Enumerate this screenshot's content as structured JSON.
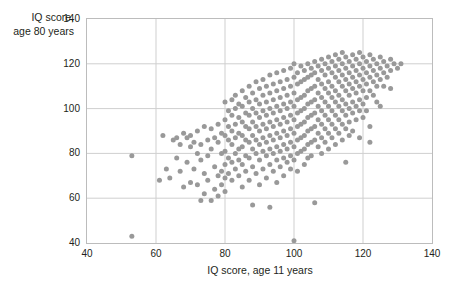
{
  "chart_data": {
    "type": "scatter",
    "title": "",
    "xlabel": "IQ score, age 11 years",
    "ylabel": "IQ score,\nage 80 years",
    "xlim": [
      40,
      140
    ],
    "ylim": [
      40,
      140
    ],
    "xticks": [
      40,
      60,
      80,
      100,
      120,
      140
    ],
    "yticks": [
      40,
      60,
      80,
      100,
      120,
      140
    ],
    "grid": true,
    "legend": null,
    "point_color": "#999999",
    "point_size": 5,
    "n_points": 349,
    "points": [
      [
        53,
        79
      ],
      [
        53,
        43
      ],
      [
        61,
        68
      ],
      [
        62,
        88
      ],
      [
        63,
        73
      ],
      [
        64,
        69
      ],
      [
        65,
        86
      ],
      [
        66,
        87
      ],
      [
        66,
        78
      ],
      [
        67,
        84
      ],
      [
        67,
        72
      ],
      [
        68,
        89
      ],
      [
        68,
        65
      ],
      [
        69,
        87
      ],
      [
        69,
        76
      ],
      [
        70,
        88
      ],
      [
        70,
        83
      ],
      [
        70,
        67
      ],
      [
        71,
        85
      ],
      [
        71,
        73
      ],
      [
        72,
        90
      ],
      [
        72,
        80
      ],
      [
        72,
        66
      ],
      [
        73,
        84
      ],
      [
        73,
        77
      ],
      [
        73,
        59
      ],
      [
        74,
        92
      ],
      [
        74,
        71
      ],
      [
        74,
        62
      ],
      [
        75,
        86
      ],
      [
        75,
        79
      ],
      [
        75,
        68
      ],
      [
        76,
        91
      ],
      [
        76,
        82
      ],
      [
        76,
        59
      ],
      [
        77,
        87
      ],
      [
        77,
        74
      ],
      [
        77,
        64
      ],
      [
        78,
        93
      ],
      [
        78,
        85
      ],
      [
        78,
        70
      ],
      [
        78,
        61
      ],
      [
        79,
        89
      ],
      [
        79,
        80
      ],
      [
        79,
        72
      ],
      [
        79,
        66
      ],
      [
        80,
        103
      ],
      [
        80,
        95
      ],
      [
        80,
        88
      ],
      [
        80,
        81
      ],
      [
        80,
        75
      ],
      [
        80,
        69
      ],
      [
        80,
        63
      ],
      [
        81,
        99
      ],
      [
        81,
        92
      ],
      [
        81,
        86
      ],
      [
        81,
        78
      ],
      [
        81,
        71
      ],
      [
        82,
        104
      ],
      [
        82,
        97
      ],
      [
        82,
        90
      ],
      [
        82,
        84
      ],
      [
        82,
        76
      ],
      [
        82,
        68
      ],
      [
        83,
        106
      ],
      [
        83,
        100
      ],
      [
        83,
        93
      ],
      [
        83,
        87
      ],
      [
        83,
        80
      ],
      [
        83,
        73
      ],
      [
        84,
        102
      ],
      [
        84,
        96
      ],
      [
        84,
        89
      ],
      [
        84,
        82
      ],
      [
        84,
        77
      ],
      [
        84,
        70
      ],
      [
        85,
        108
      ],
      [
        85,
        101
      ],
      [
        85,
        94
      ],
      [
        85,
        88
      ],
      [
        85,
        83
      ],
      [
        85,
        75
      ],
      [
        85,
        65
      ],
      [
        86,
        105
      ],
      [
        86,
        98
      ],
      [
        86,
        92
      ],
      [
        86,
        86
      ],
      [
        86,
        79
      ],
      [
        86,
        72
      ],
      [
        87,
        110
      ],
      [
        87,
        103
      ],
      [
        87,
        97
      ],
      [
        87,
        91
      ],
      [
        87,
        85
      ],
      [
        87,
        78
      ],
      [
        87,
        68
      ],
      [
        88,
        107
      ],
      [
        88,
        100
      ],
      [
        88,
        94
      ],
      [
        88,
        88
      ],
      [
        88,
        82
      ],
      [
        88,
        74
      ],
      [
        88,
        57
      ],
      [
        89,
        112
      ],
      [
        89,
        104
      ],
      [
        89,
        98
      ],
      [
        89,
        92
      ],
      [
        89,
        86
      ],
      [
        89,
        80
      ],
      [
        89,
        71
      ],
      [
        90,
        109
      ],
      [
        90,
        102
      ],
      [
        90,
        96
      ],
      [
        90,
        90
      ],
      [
        90,
        84
      ],
      [
        90,
        77
      ],
      [
        90,
        66
      ],
      [
        91,
        113
      ],
      [
        91,
        106
      ],
      [
        91,
        99
      ],
      [
        91,
        93
      ],
      [
        91,
        87
      ],
      [
        91,
        81
      ],
      [
        91,
        73
      ],
      [
        92,
        110
      ],
      [
        92,
        103
      ],
      [
        92,
        97
      ],
      [
        92,
        91
      ],
      [
        92,
        85
      ],
      [
        92,
        79
      ],
      [
        92,
        69
      ],
      [
        93,
        115
      ],
      [
        93,
        107
      ],
      [
        93,
        100
      ],
      [
        93,
        94
      ],
      [
        93,
        88
      ],
      [
        93,
        82
      ],
      [
        93,
        75
      ],
      [
        93,
        56
      ],
      [
        94,
        111
      ],
      [
        94,
        104
      ],
      [
        94,
        98
      ],
      [
        94,
        92
      ],
      [
        94,
        86
      ],
      [
        94,
        80
      ],
      [
        94,
        72
      ],
      [
        95,
        116
      ],
      [
        95,
        108
      ],
      [
        95,
        101
      ],
      [
        95,
        95
      ],
      [
        95,
        89
      ],
      [
        95,
        83
      ],
      [
        95,
        77
      ],
      [
        95,
        67
      ],
      [
        96,
        112
      ],
      [
        96,
        105
      ],
      [
        96,
        99
      ],
      [
        96,
        93
      ],
      [
        96,
        87
      ],
      [
        96,
        81
      ],
      [
        96,
        74
      ],
      [
        97,
        117
      ],
      [
        97,
        109
      ],
      [
        97,
        102
      ],
      [
        97,
        96
      ],
      [
        97,
        90
      ],
      [
        97,
        84
      ],
      [
        97,
        78
      ],
      [
        97,
        70
      ],
      [
        98,
        113
      ],
      [
        98,
        106
      ],
      [
        98,
        100
      ],
      [
        98,
        94
      ],
      [
        98,
        88
      ],
      [
        98,
        82
      ],
      [
        98,
        76
      ],
      [
        99,
        118
      ],
      [
        99,
        110
      ],
      [
        99,
        103
      ],
      [
        99,
        97
      ],
      [
        99,
        91
      ],
      [
        99,
        85
      ],
      [
        99,
        79
      ],
      [
        99,
        73
      ],
      [
        100,
        120
      ],
      [
        100,
        114
      ],
      [
        100,
        107
      ],
      [
        100,
        101
      ],
      [
        100,
        95
      ],
      [
        100,
        89
      ],
      [
        100,
        83
      ],
      [
        100,
        77
      ],
      [
        100,
        41
      ],
      [
        101,
        116
      ],
      [
        101,
        111
      ],
      [
        101,
        104
      ],
      [
        101,
        98
      ],
      [
        101,
        92
      ],
      [
        101,
        86
      ],
      [
        101,
        80
      ],
      [
        101,
        72
      ],
      [
        102,
        119
      ],
      [
        102,
        112
      ],
      [
        102,
        105
      ],
      [
        102,
        99
      ],
      [
        102,
        93
      ],
      [
        102,
        87
      ],
      [
        102,
        81
      ],
      [
        103,
        117
      ],
      [
        103,
        113
      ],
      [
        103,
        106
      ],
      [
        103,
        100
      ],
      [
        103,
        94
      ],
      [
        103,
        88
      ],
      [
        103,
        82
      ],
      [
        103,
        75
      ],
      [
        104,
        120
      ],
      [
        104,
        114
      ],
      [
        104,
        108
      ],
      [
        104,
        102
      ],
      [
        104,
        96
      ],
      [
        104,
        90
      ],
      [
        104,
        84
      ],
      [
        104,
        78
      ],
      [
        105,
        118
      ],
      [
        105,
        115
      ],
      [
        105,
        109
      ],
      [
        105,
        103
      ],
      [
        105,
        97
      ],
      [
        105,
        91
      ],
      [
        105,
        85
      ],
      [
        105,
        79
      ],
      [
        106,
        121
      ],
      [
        106,
        116
      ],
      [
        106,
        110
      ],
      [
        106,
        104
      ],
      [
        106,
        98
      ],
      [
        106,
        92
      ],
      [
        106,
        86
      ],
      [
        106,
        58
      ],
      [
        107,
        119
      ],
      [
        107,
        113
      ],
      [
        107,
        107
      ],
      [
        107,
        101
      ],
      [
        107,
        95
      ],
      [
        107,
        89
      ],
      [
        107,
        83
      ],
      [
        108,
        122
      ],
      [
        108,
        117
      ],
      [
        108,
        111
      ],
      [
        108,
        105
      ],
      [
        108,
        99
      ],
      [
        108,
        93
      ],
      [
        108,
        87
      ],
      [
        108,
        80
      ],
      [
        109,
        120
      ],
      [
        109,
        115
      ],
      [
        109,
        109
      ],
      [
        109,
        103
      ],
      [
        109,
        97
      ],
      [
        109,
        91
      ],
      [
        109,
        85
      ],
      [
        110,
        123
      ],
      [
        110,
        118
      ],
      [
        110,
        112
      ],
      [
        110,
        107
      ],
      [
        110,
        101
      ],
      [
        110,
        95
      ],
      [
        110,
        89
      ],
      [
        110,
        82
      ],
      [
        111,
        121
      ],
      [
        111,
        116
      ],
      [
        111,
        110
      ],
      [
        111,
        105
      ],
      [
        111,
        99
      ],
      [
        111,
        93
      ],
      [
        111,
        87
      ],
      [
        112,
        124
      ],
      [
        112,
        119
      ],
      [
        112,
        114
      ],
      [
        112,
        108
      ],
      [
        112,
        103
      ],
      [
        112,
        97
      ],
      [
        112,
        91
      ],
      [
        112,
        84
      ],
      [
        113,
        122
      ],
      [
        113,
        117
      ],
      [
        113,
        112
      ],
      [
        113,
        106
      ],
      [
        113,
        101
      ],
      [
        113,
        95
      ],
      [
        113,
        89
      ],
      [
        114,
        125
      ],
      [
        114,
        120
      ],
      [
        114,
        115
      ],
      [
        114,
        110
      ],
      [
        114,
        104
      ],
      [
        114,
        99
      ],
      [
        114,
        93
      ],
      [
        114,
        86
      ],
      [
        115,
        123
      ],
      [
        115,
        118
      ],
      [
        115,
        113
      ],
      [
        115,
        108
      ],
      [
        115,
        102
      ],
      [
        115,
        97
      ],
      [
        115,
        91
      ],
      [
        115,
        76
      ],
      [
        116,
        121
      ],
      [
        116,
        116
      ],
      [
        116,
        111
      ],
      [
        116,
        106
      ],
      [
        116,
        100
      ],
      [
        116,
        94
      ],
      [
        116,
        88
      ],
      [
        117,
        124
      ],
      [
        117,
        119
      ],
      [
        117,
        114
      ],
      [
        117,
        109
      ],
      [
        117,
        103
      ],
      [
        117,
        98
      ],
      [
        117,
        90
      ],
      [
        118,
        122
      ],
      [
        118,
        117
      ],
      [
        118,
        112
      ],
      [
        118,
        107
      ],
      [
        118,
        101
      ],
      [
        118,
        95
      ],
      [
        119,
        125
      ],
      [
        119,
        120
      ],
      [
        119,
        115
      ],
      [
        119,
        110
      ],
      [
        119,
        104
      ],
      [
        119,
        99
      ],
      [
        119,
        87
      ],
      [
        120,
        123
      ],
      [
        120,
        118
      ],
      [
        120,
        113
      ],
      [
        120,
        108
      ],
      [
        120,
        102
      ],
      [
        120,
        96
      ],
      [
        121,
        121
      ],
      [
        121,
        116
      ],
      [
        121,
        111
      ],
      [
        121,
        105
      ],
      [
        121,
        99
      ],
      [
        122,
        124
      ],
      [
        122,
        119
      ],
      [
        122,
        114
      ],
      [
        122,
        108
      ],
      [
        122,
        92
      ],
      [
        122,
        85
      ],
      [
        123,
        122
      ],
      [
        123,
        117
      ],
      [
        123,
        112
      ],
      [
        123,
        106
      ],
      [
        124,
        120
      ],
      [
        124,
        115
      ],
      [
        124,
        110
      ],
      [
        124,
        103
      ],
      [
        125,
        123
      ],
      [
        125,
        118
      ],
      [
        125,
        113
      ],
      [
        125,
        101
      ],
      [
        126,
        121
      ],
      [
        126,
        116
      ],
      [
        126,
        110
      ],
      [
        127,
        119
      ],
      [
        127,
        114
      ],
      [
        128,
        122
      ],
      [
        128,
        117
      ],
      [
        128,
        109
      ],
      [
        129,
        120
      ],
      [
        130,
        118
      ],
      [
        131,
        120
      ]
    ]
  }
}
